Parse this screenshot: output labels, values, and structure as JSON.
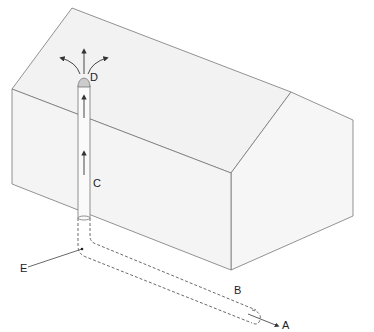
{
  "diagram": {
    "type": "radon-mitigation-house-cutaway",
    "labels": {
      "A": "A",
      "B": "B",
      "C": "C",
      "D": "D",
      "E": "E"
    },
    "colors": {
      "background": "#ffffff",
      "house_fill": "#f3f3f3",
      "house_side_fill": "#f7f7f7",
      "outline": "#777777",
      "pipe_fill": "#fafafa",
      "arrow": "#333333"
    }
  }
}
